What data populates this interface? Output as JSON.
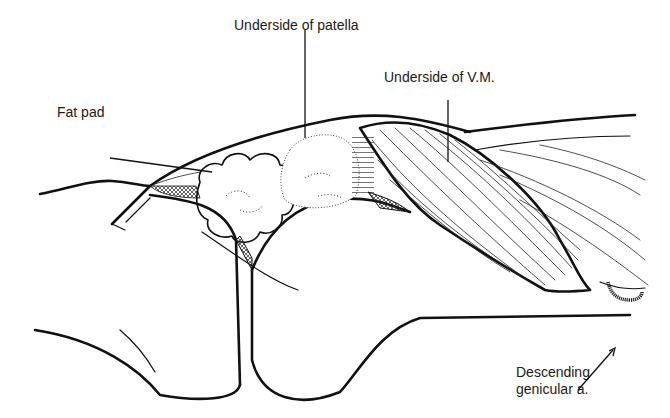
{
  "figure": {
    "type": "anatomical line drawing",
    "labels": {
      "patella": "Underside of patella",
      "vm": "Underside of V.M.",
      "fat_pad": "Fat pad",
      "artery_line1": "Descending",
      "artery_line2": "genicular a."
    },
    "colors": {
      "ink": "#111111",
      "background": "#ffffff"
    }
  }
}
